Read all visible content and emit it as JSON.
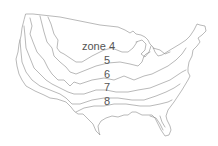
{
  "map": {
    "title": "",
    "region": "contiguous United States",
    "line_color": "#8a8a8a",
    "background": "#ffffff",
    "labels": [
      {
        "text": "zone 4",
        "x": 82,
        "y": 41
      },
      {
        "text": "5",
        "x": 104,
        "y": 55
      },
      {
        "text": "6",
        "x": 104,
        "y": 69
      },
      {
        "text": "7",
        "x": 104,
        "y": 82
      },
      {
        "text": "8",
        "x": 104,
        "y": 96
      }
    ]
  }
}
